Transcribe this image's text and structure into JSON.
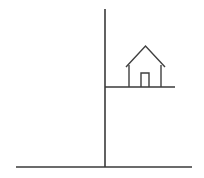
{
  "scene": {
    "title": "House on ledge line drawing",
    "background_color": "#ffffff",
    "stroke_color": "#3a3a3a",
    "width": 204,
    "height": 178
  },
  "elements": {
    "vertical_pole": {
      "name": "vertical-line",
      "x1": 105,
      "y1": 9,
      "x2": 105,
      "y2": 167
    },
    "ledge": {
      "name": "horizontal-shelf-line",
      "x1": 105,
      "y1": 87,
      "x2": 175,
      "y2": 87
    },
    "ground": {
      "name": "ground-baseline",
      "x1": 16,
      "y1": 167,
      "x2": 192,
      "y2": 167
    },
    "house": {
      "name": "house-shape",
      "roof_apex_x": 145.5,
      "roof_apex_y": 46,
      "roof_left_x": 126,
      "roof_left_y": 67,
      "roof_right_x": 165,
      "roof_right_y": 67,
      "wall_left_x": 129,
      "wall_right_x": 161,
      "wall_top_y": 65,
      "wall_bottom_y": 87,
      "door_left_x": 141,
      "door_right_x": 149,
      "door_top_y": 73,
      "door_bottom_y": 87
    }
  },
  "labels": {
    "figure_caption": ""
  }
}
